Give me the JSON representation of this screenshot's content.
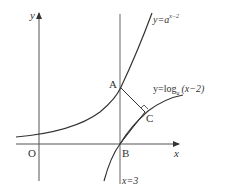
{
  "diagram": {
    "type": "function-graph",
    "axes": {
      "x_label": "x",
      "y_label": "y",
      "origin_label": "O"
    },
    "curves": [
      {
        "name": "exponential",
        "label_prefix": "y=a",
        "label_exponent": "x−2"
      },
      {
        "name": "logarithm",
        "label_prefix": "y=log",
        "label_subscript": "a",
        "label_suffix": "(x−2)"
      }
    ],
    "vertical_line": {
      "label": "x=3"
    },
    "points": {
      "A": "A",
      "B": "B",
      "C": "C"
    },
    "colors": {
      "stroke": "#333333",
      "axis": "#555555",
      "background": "#ffffff"
    }
  }
}
